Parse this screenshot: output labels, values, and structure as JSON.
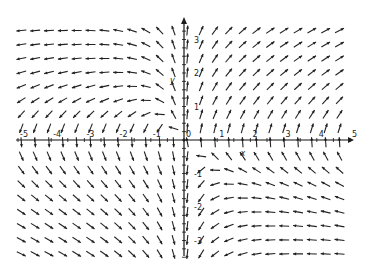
{
  "chart_data": {
    "type": "vector_field",
    "title": "",
    "xlabel": "x",
    "ylabel": "y",
    "xlim": [
      -5,
      5
    ],
    "ylim": [
      -3.5,
      3.5
    ],
    "field": {
      "dx": "x*y",
      "dy": "x+y"
    },
    "grid_step": 0.4167,
    "x_ticks": [
      -5,
      -4,
      -3,
      -2,
      -1,
      0,
      1,
      2,
      3,
      4,
      5
    ],
    "x_tick_labels": [
      "-5",
      "-4",
      "-3",
      "-2",
      "-1",
      "0",
      "1",
      "2",
      "3",
      "4",
      "5"
    ],
    "y_ticks": [
      -3,
      -2,
      -1,
      1,
      2,
      3
    ],
    "y_tick_labels": [
      "-3",
      "-2",
      "-1",
      "1",
      "2",
      "3"
    ],
    "grid": false,
    "legend": "none"
  }
}
